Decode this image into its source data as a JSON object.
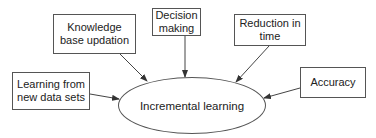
{
  "diagram": {
    "center": {
      "label": "Incremental learning"
    },
    "nodes": [
      {
        "id": "knowledge",
        "label_line1": "Knowledge",
        "label_line2": "base updation"
      },
      {
        "id": "decision",
        "label_line1": "Decision",
        "label_line2": "making"
      },
      {
        "id": "reduction",
        "label_line1": "Reduction in",
        "label_line2": "time"
      },
      {
        "id": "accuracy",
        "label_line1": "Accuracy"
      },
      {
        "id": "learning",
        "label_line1": "Learning from",
        "label_line2": "new data sets"
      }
    ],
    "edges": [
      {
        "from": "knowledge",
        "to": "center"
      },
      {
        "from": "decision",
        "to": "center"
      },
      {
        "from": "reduction",
        "to": "center"
      },
      {
        "from": "accuracy",
        "to": "center"
      },
      {
        "from": "learning",
        "to": "center"
      }
    ]
  }
}
